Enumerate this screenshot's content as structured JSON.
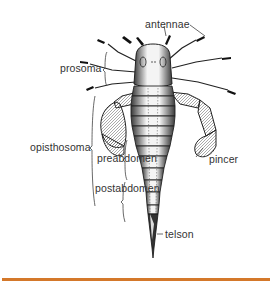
{
  "diagram": {
    "labels": {
      "antennae": "antennae",
      "prosoma": "prosoma",
      "opisthosoma": "opisthosoma",
      "preabdomen": "preabdomen",
      "postabdomen": "postabdomen",
      "pincer": "pincer",
      "telson": "telson"
    }
  },
  "colors": {
    "background": "#ffffff",
    "ink": "#222222",
    "label_text": "#333333",
    "bottom_bar": "#d4782a"
  }
}
